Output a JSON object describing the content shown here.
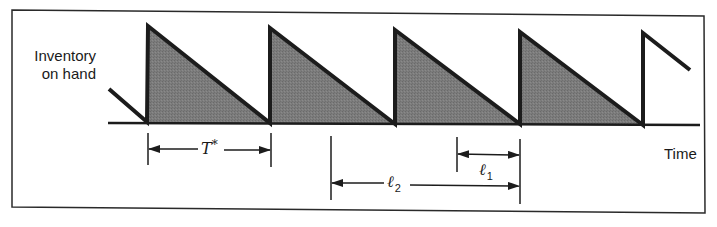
{
  "diagram": {
    "type": "sawtooth-inventory-cycle",
    "y_axis_label": [
      "Inventory",
      "on hand"
    ],
    "x_axis_label": "Time",
    "colors": {
      "line": "#1c1c1c",
      "fill": "#7a7a7a",
      "frame": "#2a2a2a",
      "background": "#ffffff"
    },
    "cycles": [
      {
        "order_x": 148,
        "end_x": 270,
        "shaded": true
      },
      {
        "order_x": 270,
        "end_x": 395,
        "shaded": true
      },
      {
        "order_x": 395,
        "end_x": 520,
        "shaded": true
      },
      {
        "order_x": 520,
        "end_x": 643,
        "shaded": true
      },
      {
        "order_x": 643,
        "end_x": 690,
        "shaded": false
      }
    ],
    "dimensions": {
      "cycle_time": {
        "symbol": "T",
        "superscript": "*",
        "from_x": 148,
        "to_x": 270
      },
      "lead_time_1": {
        "symbol": "ℓ",
        "subscript": "1",
        "from_x": 457,
        "to_x": 520
      },
      "lead_time_2": {
        "symbol": "ℓ",
        "subscript": "2",
        "from_x": 331,
        "to_x": 520
      }
    }
  }
}
